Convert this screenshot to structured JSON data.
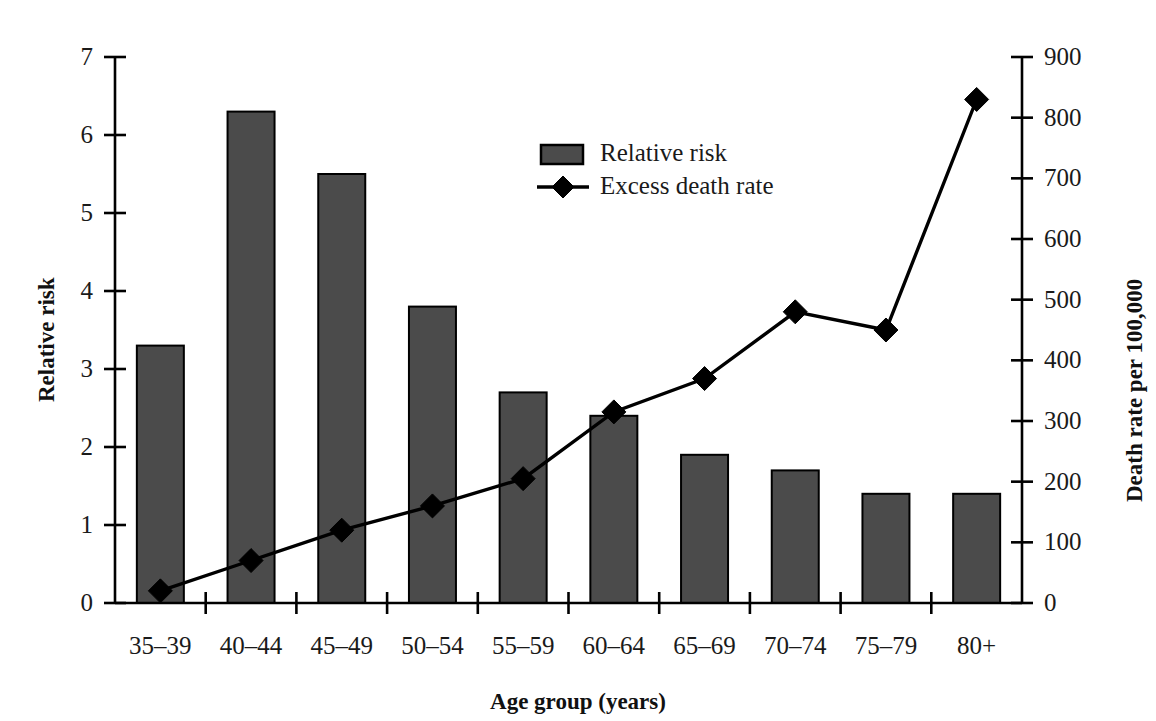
{
  "chart_data": {
    "type": "bar",
    "title": "",
    "xlabel": "Age group (years)",
    "ylabel": "Relative risk",
    "y2label": "Death rate per 100,000",
    "categories": [
      "35–39",
      "40–44",
      "45–49",
      "50–54",
      "55–59",
      "60–64",
      "65–69",
      "70–74",
      "75–79",
      "80+"
    ],
    "ylim": [
      0,
      7
    ],
    "y2lim": [
      0,
      900
    ],
    "yticks": [
      0,
      1,
      2,
      3,
      4,
      5,
      6,
      7
    ],
    "ytick_labels": [
      "0",
      "1",
      "2",
      "3",
      "4",
      "5",
      "6",
      "7"
    ],
    "y2ticks": [
      0,
      100,
      200,
      300,
      400,
      500,
      600,
      700,
      800,
      900
    ],
    "y2tick_labels": [
      "0",
      "100",
      "200",
      "300",
      "400",
      "500",
      "600",
      "700",
      "800",
      "900"
    ],
    "grid": false,
    "legend_position": "upper-center",
    "series": [
      {
        "name": "Relative risk",
        "kind": "bar",
        "axis": "left",
        "color": "#4b4b4b",
        "values": [
          3.3,
          6.3,
          5.5,
          3.8,
          2.7,
          2.4,
          1.9,
          1.7,
          1.4,
          1.4
        ]
      },
      {
        "name": "Excess death rate",
        "kind": "line",
        "axis": "right",
        "color": "#000000",
        "marker": "diamond",
        "values": [
          20,
          70,
          120,
          160,
          205,
          315,
          370,
          480,
          450,
          830
        ]
      }
    ]
  },
  "legend": {
    "items": [
      {
        "label": "Relative risk",
        "type": "swatch"
      },
      {
        "label": "Excess death rate",
        "type": "line-marker"
      }
    ]
  },
  "axes": {
    "left_title": "Relative risk",
    "right_title": "Death rate per 100,000",
    "bottom_title": "Age group (years)"
  }
}
